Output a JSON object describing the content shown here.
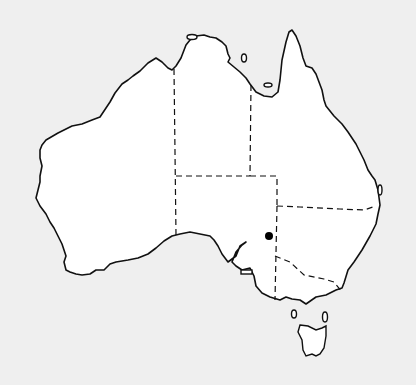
{
  "map": {
    "subject": "Australia outline map with state borders",
    "colors": {
      "background": "#efefef",
      "land": "#ffffff",
      "outline": "#111111",
      "marker": "#000000"
    },
    "marker": {
      "x": 269,
      "y": 236,
      "label": ""
    }
  }
}
